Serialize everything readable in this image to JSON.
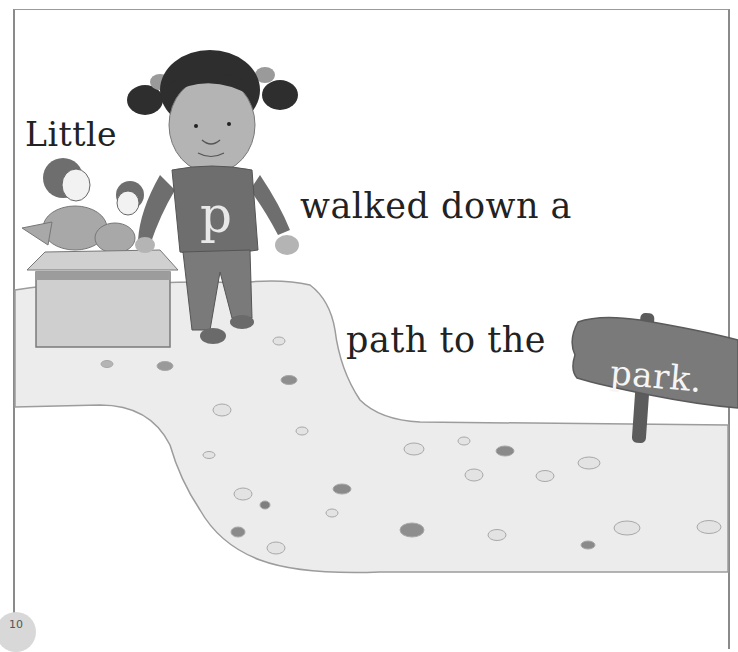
{
  "story": {
    "line1": "Little",
    "line2": "walked down a",
    "line3": "path to the",
    "sign_word": "park."
  },
  "illustration": {
    "girl_sweater_letter": "p",
    "elements": [
      "girl-character",
      "toy-box",
      "stone-path",
      "park-sign"
    ]
  },
  "page": {
    "number": "10"
  },
  "colors": {
    "path_fill": "#ececec",
    "path_edge": "#9a9a9a",
    "sweater": "#6e6e6e",
    "sign": "#7a7a7a",
    "text": "#222222"
  }
}
